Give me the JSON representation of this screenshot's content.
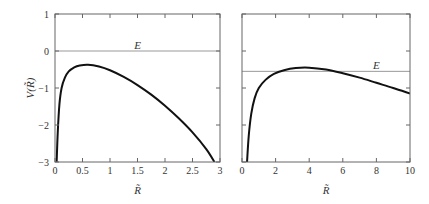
{
  "chart_data": [
    {
      "type": "line",
      "title": "",
      "xlabel": "R̃",
      "ylabel": "V(R̃)",
      "xlim": [
        0,
        3
      ],
      "ylim": [
        -3,
        1
      ],
      "grid": false,
      "xticks": [
        0,
        0.5,
        1,
        1.5,
        2,
        2.5,
        3
      ],
      "xtick_labels": [
        "0",
        "0.5",
        "1",
        "1.5",
        "2",
        "2.5",
        "3"
      ],
      "yticks": [
        1,
        0,
        -1,
        -2,
        -3
      ],
      "ytick_labels": [
        "1",
        "0",
        "−1",
        "−2",
        "−3"
      ],
      "annotations": [
        {
          "text": "E",
          "x": 1.5,
          "y": 0.15
        }
      ],
      "hlines": [
        {
          "name": "E",
          "y": 0
        }
      ],
      "series": [
        {
          "name": "V(R)",
          "x": [
            0.03,
            0.05,
            0.08,
            0.12,
            0.18,
            0.25,
            0.35,
            0.45,
            0.6,
            0.8,
            1.0,
            1.25,
            1.5,
            1.75,
            2.0,
            2.25,
            2.5,
            2.75,
            2.9
          ],
          "y": [
            -3.0,
            -2.2,
            -1.45,
            -1.0,
            -0.72,
            -0.55,
            -0.44,
            -0.39,
            -0.37,
            -0.42,
            -0.52,
            -0.7,
            -0.92,
            -1.18,
            -1.48,
            -1.82,
            -2.2,
            -2.65,
            -3.0
          ]
        }
      ]
    },
    {
      "type": "line",
      "title": "",
      "xlabel": "R̃",
      "ylabel": "",
      "xlim": [
        0,
        10
      ],
      "ylim": [
        -3,
        1
      ],
      "grid": false,
      "xticks": [
        0,
        2,
        4,
        6,
        8,
        10
      ],
      "xtick_labels": [
        "0",
        "2",
        "4",
        "6",
        "8",
        "10"
      ],
      "yticks": [
        1,
        0,
        -1,
        -2,
        -3
      ],
      "ytick_labels": [],
      "annotations": [
        {
          "text": "E",
          "x": 8.0,
          "y": -0.38
        }
      ],
      "hlines": [
        {
          "name": "E",
          "y": -0.55
        }
      ],
      "series": [
        {
          "name": "V(R)",
          "x": [
            0.3,
            0.4,
            0.55,
            0.75,
            1.0,
            1.4,
            1.9,
            2.5,
            3.2,
            4.0,
            5.0,
            6.0,
            7.0,
            8.0,
            9.0,
            10.0
          ],
          "y": [
            -3.0,
            -2.3,
            -1.7,
            -1.28,
            -1.0,
            -0.78,
            -0.62,
            -0.52,
            -0.46,
            -0.45,
            -0.5,
            -0.6,
            -0.72,
            -0.86,
            -1.0,
            -1.15
          ]
        }
      ]
    }
  ]
}
